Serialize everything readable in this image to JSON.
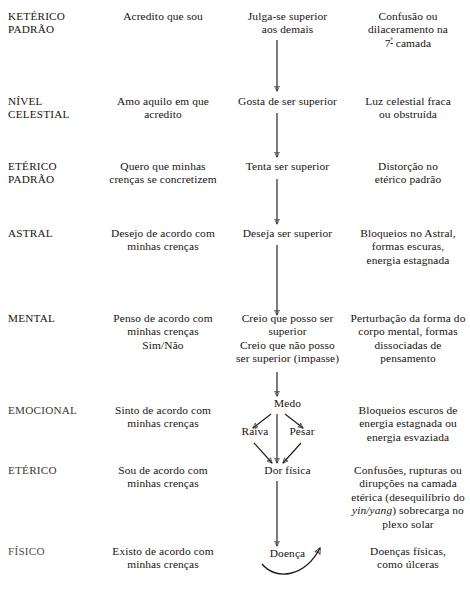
{
  "document": {
    "title": "Níveis do campo de energia humano e a cascata de uma crença",
    "language": "pt-BR",
    "background_color": "#ffffff",
    "ink_color": "#17120f"
  },
  "columns": {
    "level_header": "",
    "belief_header": "",
    "effect_header": "",
    "result_header": ""
  },
  "rows": [
    {
      "level": {
        "line1": "KETÉRICO",
        "line2": "PADRÃO"
      },
      "belief": {
        "line1": "Acredito que sou",
        "line2": "",
        "line3": ""
      },
      "effect": {
        "line1": "Julga-se superior",
        "line2": "aos demais",
        "line3": "",
        "line4": ""
      },
      "result": {
        "line1": "Confusão ou",
        "line2": "dilaceramento na",
        "line3_pre": "7",
        "line3_sup": "ª",
        "line3_post": " camada"
      }
    },
    {
      "level": {
        "line1": "NÍVEL",
        "line2": "CELESTIAL"
      },
      "belief": {
        "line1": "Amo aquilo em que",
        "line2": "acredito",
        "line3": ""
      },
      "effect": {
        "line1": "Gosta de ser superior",
        "line2": "",
        "line3": "",
        "line4": ""
      },
      "result": {
        "line1": "Luz celestial fraca",
        "line2": "ou obstruída",
        "line3_pre": "",
        "line3_sup": "",
        "line3_post": ""
      }
    },
    {
      "level": {
        "line1": "ETÉRICO",
        "line2": "PADRÃO"
      },
      "belief": {
        "line1": "Quero que minhas",
        "line2": "crenças se concretizem",
        "line3": ""
      },
      "effect": {
        "line1": "Tenta ser superior",
        "line2": "",
        "line3": "",
        "line4": ""
      },
      "result": {
        "line1": "Distorção no",
        "line2": "etérico padrão",
        "line3_pre": "",
        "line3_sup": "",
        "line3_post": ""
      }
    },
    {
      "level": {
        "line1": "ASTRAL",
        "line2": ""
      },
      "belief": {
        "line1": "Desejo de acordo com",
        "line2": "minhas crenças",
        "line3": ""
      },
      "effect": {
        "line1": "Deseja ser superior",
        "line2": "",
        "line3": "",
        "line4": ""
      },
      "result": {
        "line1": "Bloqueios no Astral,",
        "line2": "formas escuras,",
        "line3_pre": "energia estagnada",
        "line3_sup": "",
        "line3_post": ""
      }
    },
    {
      "level": {
        "line1": "MENTAL",
        "line2": ""
      },
      "belief": {
        "line1": "Penso de acordo com",
        "line2": "minhas crenças",
        "line3": "Sim/Não"
      },
      "effect": {
        "line1": "Creio que posso ser",
        "line2": "superior",
        "line3": "Creio que não posso",
        "line4": "ser superior (impasse)"
      },
      "result": {
        "line1": "Perturbação da forma do",
        "line2": "corpo mental, formas",
        "line3_pre": "dissociadas de",
        "line3_sup": "",
        "line3_post": "",
        "line4": "pensamento"
      }
    },
    {
      "level": {
        "line1": "EMOCIONAL",
        "line2": ""
      },
      "belief": {
        "line1": "Sinto de acordo com",
        "line2": "minhas crenças",
        "line3": ""
      },
      "effect": {
        "line1": "Medo",
        "line2": "",
        "line3": "",
        "line4": ""
      },
      "result": {
        "line1": "Bloqueios escuros de",
        "line2": "energia estagnada ou",
        "line3_pre": "energia esvaziada",
        "line3_sup": "",
        "line3_post": ""
      }
    },
    {
      "level": {
        "line1": "ETÉRICO",
        "line2": ""
      },
      "belief": {
        "line1": "Sou de acordo com",
        "line2": "minhas crenças",
        "line3": ""
      },
      "effect": {
        "line1": "Dor física",
        "line2": "",
        "line3": "",
        "line4": ""
      },
      "result": {
        "line1": "Confusões, rupturas ou",
        "line2": "dirupções na camada",
        "line3_pre": "etérica (desequilíbrio do",
        "line3_sup": "",
        "line3_post": ""
      }
    },
    {
      "level": {
        "line1": "FÍSICO",
        "line2": ""
      },
      "belief": {
        "line1": "Existo de acordo com",
        "line2": "minhas crenças",
        "line3": ""
      },
      "effect": {
        "line1": "Doença",
        "line2": "",
        "line3": "",
        "line4": ""
      },
      "result": {
        "line1": "Doenças físicas,",
        "line2": "como úlceras",
        "line3_pre": "",
        "line3_sup": "",
        "line3_post": ""
      }
    }
  ],
  "emotional_branches": {
    "center": "Medo",
    "left": "Raiva",
    "right": "Pesar",
    "converge_to": "Dor física"
  },
  "etheric_note": {
    "line1": "Confusões, rupturas ou",
    "line2": "dirupções na camada",
    "line3": "etérica (desequilíbrio do",
    "line4_italic": "yin/yang",
    "line4_rest": ") sobrecarga no",
    "line5": "plexo solar"
  },
  "arrows": {
    "style": "thin-line-with-open-arrowhead",
    "color": "#211b17",
    "vertical_count": 8,
    "branch_count": 4,
    "curved_feedback_arrow": true
  }
}
